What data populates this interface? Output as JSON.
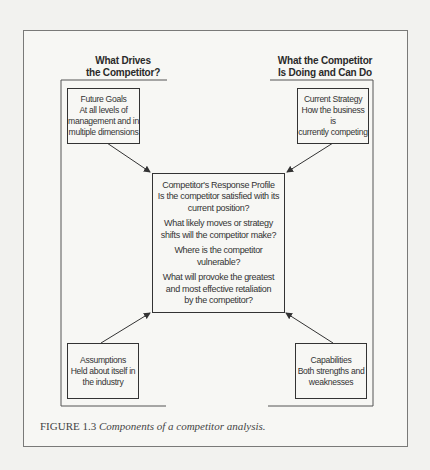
{
  "diagram": {
    "headings": {
      "left": [
        "What Drives",
        "the Competitor?"
      ],
      "right": [
        "What the Competitor",
        "Is Doing and Can Do"
      ]
    },
    "boxes": {
      "future_goals": [
        "Future Goals",
        "At all levels of",
        "management and in",
        "multiple dimensions"
      ],
      "current_strategy": [
        "Current Strategy",
        "How the business is",
        "currently competing"
      ],
      "assumptions": [
        "Assumptions",
        "Held about itself in",
        "the industry"
      ],
      "capabilities": [
        "Capabilities",
        "Both strengths and",
        "weaknesses"
      ],
      "response_profile": {
        "title": "Competitor's Response Profile",
        "questions": [
          [
            "Is the competitor satisfied with its",
            "current position?"
          ],
          [
            "What likely moves or strategy",
            "shifts will the competitor make?"
          ],
          [
            "Where is the competitor vulnerable?"
          ],
          [
            "What will provoke the greatest",
            "and most effective retaliation",
            "by the competitor?"
          ]
        ]
      }
    },
    "caption": {
      "label": "FIGURE 1.3",
      "text": "Components of a competitor analysis."
    },
    "edges": [
      {
        "from": "future_goals",
        "to": "response_profile"
      },
      {
        "from": "current_strategy",
        "to": "response_profile"
      },
      {
        "from": "assumptions",
        "to": "response_profile"
      },
      {
        "from": "capabilities",
        "to": "response_profile"
      }
    ]
  }
}
